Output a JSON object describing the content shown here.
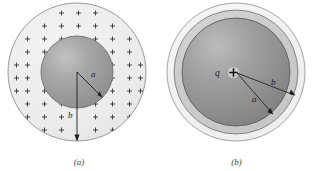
{
  "figure": {
    "kind": "physics-diagram",
    "background_color": "#ffffff"
  },
  "panel_a": {
    "caption": "(a)",
    "radius_inner_label": "a",
    "radius_outer_label": "b",
    "charge_glyph": "+",
    "charge_count": 64,
    "outer_fill_color": "#ececec",
    "outer_stroke_color": "#8e8e8e",
    "inner_fill_color": "#9a9a9a",
    "inner_highlight_color": "#bdbdbd",
    "inner_stroke_color": "#6f6f6f",
    "leader_color": "#1d1d1d",
    "geometry": {
      "center_x": 77,
      "center_y": 72,
      "outer_radius": 69,
      "inner_radius": 36
    }
  },
  "panel_b": {
    "caption": "(b)",
    "charge_symbol": "q",
    "charge_glyph": "+",
    "radius_inner_label": "a",
    "radius_outer_label": "b",
    "shell_fill_color": "#f2f2f2",
    "shell_stroke_color": "#9a9a9a",
    "annulus_fill_color": "#c9c9c9",
    "annulus_stroke_color": "#7c7c7c",
    "core_fill_color": "#8e8e8e",
    "core_highlight_color": "#b5b5b5",
    "core_stroke_color": "#5e5e5e",
    "leader_color": "#1d1d1d",
    "geometry": {
      "center_x": 78,
      "center_y": 72,
      "shell_radius": 69,
      "annulus_radius": 62,
      "core_radius": 54
    }
  }
}
